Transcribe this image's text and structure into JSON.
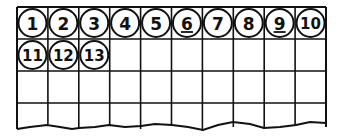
{
  "grid": {
    "columns": 10,
    "rows": 4,
    "cells": [
      {
        "label": "1",
        "underlined": false
      },
      {
        "label": "2",
        "underlined": false
      },
      {
        "label": "3",
        "underlined": false
      },
      {
        "label": "4",
        "underlined": false
      },
      {
        "label": "5",
        "underlined": false
      },
      {
        "label": "6",
        "underlined": true
      },
      {
        "label": "7",
        "underlined": false
      },
      {
        "label": "8",
        "underlined": false
      },
      {
        "label": "9",
        "underlined": true
      },
      {
        "label": "10",
        "underlined": false
      },
      {
        "label": "11",
        "underlined": false
      },
      {
        "label": "12",
        "underlined": false
      },
      {
        "label": "13",
        "underlined": false
      }
    ],
    "bottom_edge": "torn"
  },
  "colors": {
    "line": "#111111",
    "background": "#ffffff"
  }
}
